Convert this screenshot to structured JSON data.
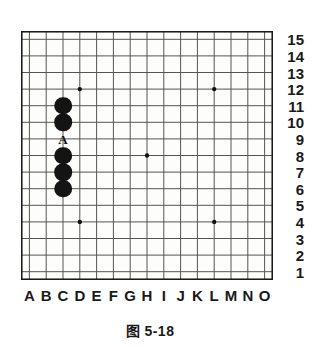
{
  "figure": {
    "caption": "图 5-18",
    "board": {
      "size": 15,
      "column_labels": [
        "A",
        "B",
        "C",
        "D",
        "E",
        "F",
        "G",
        "H",
        "I",
        "J",
        "K",
        "L",
        "M",
        "N",
        "O"
      ],
      "row_labels": [
        "15",
        "14",
        "13",
        "12",
        "11",
        "10",
        "9",
        "8",
        "7",
        "6",
        "5",
        "4",
        "3",
        "2",
        "1"
      ],
      "grid_color": "#555555",
      "border_color": "#1a1a1a",
      "background_color": "#fdfdfb",
      "star_point_color": "#111111",
      "star_points": [
        {
          "col": "D",
          "row": 12
        },
        {
          "col": "L",
          "row": 12
        },
        {
          "col": "H",
          "row": 8
        },
        {
          "col": "D",
          "row": 4
        },
        {
          "col": "L",
          "row": 4
        }
      ],
      "stones": [
        {
          "col": "C",
          "row": 11,
          "color": "black"
        },
        {
          "col": "C",
          "row": 10,
          "color": "black"
        },
        {
          "col": "C",
          "row": 8,
          "color": "black"
        },
        {
          "col": "C",
          "row": 7,
          "color": "black"
        },
        {
          "col": "C",
          "row": 6,
          "color": "black"
        }
      ],
      "markers": [
        {
          "col": "C",
          "row": 9,
          "label": "A"
        }
      ]
    }
  }
}
